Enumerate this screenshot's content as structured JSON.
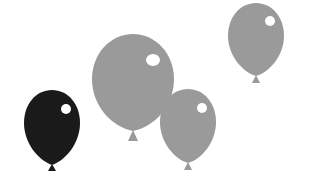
{
  "scene": {
    "description": "Four balloons illustration",
    "background": "#ffffff"
  },
  "balloons": [
    {
      "id": "black-balloon",
      "color": "#1a1a1a",
      "highlight": "#ffffff",
      "left": 24,
      "top": 90,
      "width": 56,
      "height": 76,
      "knot_h": 8
    },
    {
      "id": "large-gray-balloon",
      "color": "#9a9a9a",
      "highlight": "#ffffff",
      "left": 92,
      "top": 34,
      "width": 82,
      "height": 98,
      "knot_h": 10
    },
    {
      "id": "small-gray-balloon",
      "color": "#9a9a9a",
      "highlight": "#ffffff",
      "left": 160,
      "top": 89,
      "width": 56,
      "height": 75,
      "knot_h": 8
    },
    {
      "id": "top-right-gray-balloon",
      "color": "#9a9a9a",
      "highlight": "#ffffff",
      "left": 228,
      "top": 3,
      "width": 56,
      "height": 74,
      "knot_h": 8
    }
  ]
}
